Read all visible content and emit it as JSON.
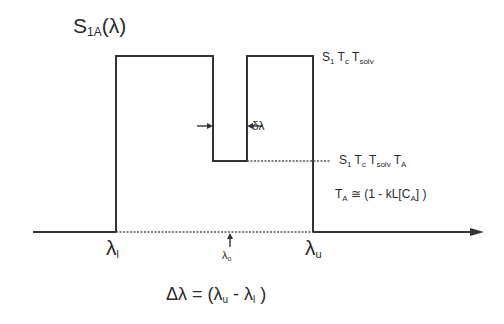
{
  "diagram": {
    "title": {
      "main": "S",
      "sub": "1A",
      "arg": "(λ)"
    },
    "levels": {
      "top": {
        "parts": [
          {
            "t": "S",
            "s": "1"
          },
          {
            "t": "T",
            "s": "c"
          },
          {
            "t": "T",
            "s": "solv"
          }
        ]
      },
      "notch": {
        "parts": [
          {
            "t": "S",
            "s": "1"
          },
          {
            "t": "T",
            "s": "c"
          },
          {
            "t": "T",
            "s": "solv"
          },
          {
            "t": "T",
            "s": "A"
          }
        ]
      }
    },
    "ta_equation": {
      "lhs": "T",
      "lhs_sub": "A",
      "rel": " ≅ (1 - kL[C",
      "inner_sub": "A",
      "close": "] )"
    },
    "notch_width_label": "δλ",
    "axis_labels": {
      "lower": {
        "main": "λ",
        "sub": "l"
      },
      "upper": {
        "main": "λ",
        "sub": "u"
      },
      "center": {
        "main": "λ",
        "sub": "o"
      }
    },
    "bandwidth_equation": {
      "lhs": "Δλ = (λ",
      "sub1": "u",
      "mid": " - λ",
      "sub2": "l",
      "close": " )"
    },
    "colors": {
      "line": "#333333",
      "dotted": "#555555"
    }
  }
}
